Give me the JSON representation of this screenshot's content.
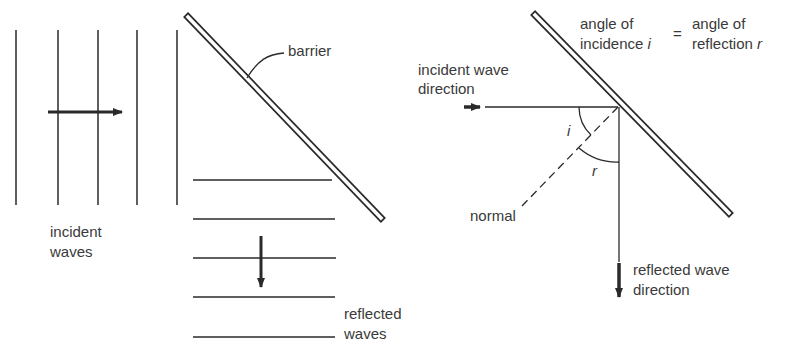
{
  "left_panel": {
    "barrier_label": "barrier",
    "incident_label_line1": "incident",
    "incident_label_line2": "waves",
    "reflected_label_line1": "reflected",
    "reflected_label_line2": "waves",
    "incident_wavefront_count": 5,
    "reflected_wavefront_count": 5
  },
  "right_panel": {
    "law_left_line1": "angle of",
    "law_left_line2": "incidence",
    "law_left_symbol": "i",
    "law_equals": "=",
    "law_right_line1": "angle of",
    "law_right_line2": "reflection",
    "law_right_symbol": "r",
    "incident_direction_line1": "incident wave",
    "incident_direction_line2": "direction",
    "normal_label": "normal",
    "angle_i_label": "i",
    "angle_r_label": "r",
    "reflected_direction_line1": "reflected wave",
    "reflected_direction_line2": "direction"
  },
  "colors": {
    "ink": "#2a2a2a",
    "text": "#3a3a3a",
    "background": "#ffffff"
  }
}
